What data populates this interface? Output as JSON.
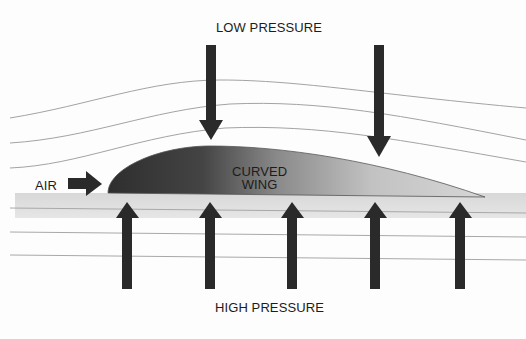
{
  "diagram": {
    "labels": {
      "top": "LOW PRESSURE",
      "bottom": "HIGH PRESSURE",
      "inflow": "AIR",
      "wing_line1": "CURVED",
      "wing_line2": "WING"
    },
    "arrows": {
      "down_count": 2,
      "up_count": 5,
      "air_count": 1
    },
    "colors": {
      "ink": "#1c1c1c",
      "arrow": "#2a2a2a",
      "wing_dark": "#3a3a3a",
      "wing_light": "#c8c8c8",
      "streamline": "#9a9a9a",
      "background": "#fdfdfd"
    }
  }
}
